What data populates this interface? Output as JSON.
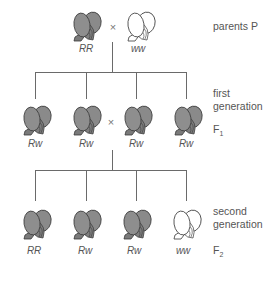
{
  "colors": {
    "red_fill": "#8a8a8a",
    "red_shade": "#6f6f6f",
    "white_fill": "#ffffff",
    "outline": "#3a3a3a",
    "line": "#6a6a6a"
  },
  "parents": {
    "label": "parents P",
    "cross_symbol": "×",
    "plants": [
      {
        "genotype": "RR",
        "color": "red"
      },
      {
        "genotype": "ww",
        "color": "white"
      }
    ]
  },
  "first_generation": {
    "label_line1": "first",
    "label_line2": "generation",
    "symbol": "F",
    "subscript": "1",
    "cross_symbol": "×",
    "plants": [
      {
        "genotype": "Rw",
        "color": "red"
      },
      {
        "genotype": "Rw",
        "color": "red"
      },
      {
        "genotype": "Rw",
        "color": "red"
      },
      {
        "genotype": "Rw",
        "color": "red"
      }
    ]
  },
  "second_generation": {
    "label_line1": "second",
    "label_line2": "generation",
    "symbol": "F",
    "subscript": "2",
    "plants": [
      {
        "genotype": "RR",
        "color": "red"
      },
      {
        "genotype": "Rw",
        "color": "red"
      },
      {
        "genotype": "Rw",
        "color": "red"
      },
      {
        "genotype": "ww",
        "color": "white"
      }
    ]
  }
}
